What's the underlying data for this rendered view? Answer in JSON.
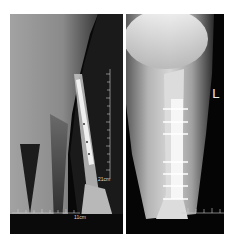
{
  "figure": {
    "panels": [
      {
        "id": "left",
        "view": "lateral radiograph",
        "ruler_labels": {
          "vertical": "21cm",
          "horizontal": "11cm"
        }
      },
      {
        "id": "right",
        "view": "anteroposterior radiograph",
        "side_marker": "L"
      }
    ]
  },
  "colors": {
    "background": "#ffffff",
    "panel_bg": "#000000",
    "soft_tissue_light": "#9a9a9a",
    "bone": "#d0d0d0",
    "implant": "#f2f2f2"
  }
}
